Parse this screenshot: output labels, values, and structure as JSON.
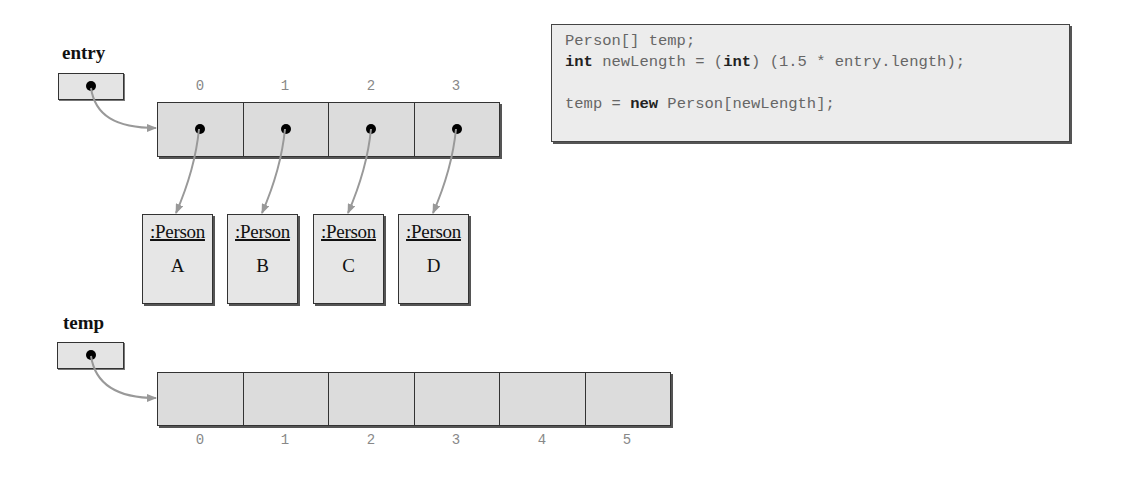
{
  "entry": {
    "label": "entry",
    "indices": [
      "0",
      "1",
      "2",
      "3"
    ]
  },
  "persons": [
    {
      "type": ":Person",
      "value": "A"
    },
    {
      "type": ":Person",
      "value": "B"
    },
    {
      "type": ":Person",
      "value": "C"
    },
    {
      "type": ":Person",
      "value": "D"
    }
  ],
  "temp": {
    "label": "temp",
    "indices": [
      "0",
      "1",
      "2",
      "3",
      "4",
      "5"
    ]
  },
  "code": {
    "line1": "Person[] temp;",
    "line2_kw1": "int",
    "line2_mid": " newLength = (",
    "line2_kw2": "int",
    "line2_end": ") (1.5 * entry.length);",
    "line3": "",
    "line4_start": "temp = ",
    "line4_kw": "new",
    "line4_end": " Person[newLength];"
  },
  "colors": {
    "cell_fill": "#dcdcdc",
    "arrow": "#999999",
    "border": "#333333"
  }
}
